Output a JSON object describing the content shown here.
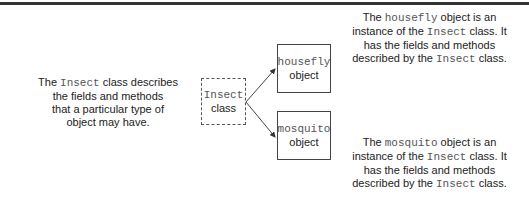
{
  "diagram": {
    "class_caption": {
      "pre": "The ",
      "code": "Insect",
      "post_lines": [
        " class describes",
        "the fields and methods",
        "that a particular type of",
        "object may have."
      ]
    },
    "class_box": {
      "name": "Insect",
      "label": "class"
    },
    "objects": [
      {
        "name": "housefly",
        "label": "object",
        "caption": {
          "l1_pre": "The ",
          "l1_code": "housefly",
          "l1_post": " object is an",
          "l2_pre": "instance of the ",
          "l2_code": "Insect",
          "l2_post": " class. It",
          "l3": "has the fields and methods",
          "l4_pre": "described by the ",
          "l4_code": "Insect",
          "l4_post": " class."
        }
      },
      {
        "name": "mosquito",
        "label": "object",
        "caption": {
          "l1_pre": "The ",
          "l1_code": "mosquito",
          "l1_post": " object is an",
          "l2_pre": "instance of the ",
          "l2_code": "Insect",
          "l2_post": " class. It",
          "l3": "has the fields and methods",
          "l4_pre": "described by the ",
          "l4_code": "Insect",
          "l4_post": " class."
        }
      }
    ],
    "colors": {
      "rule": "#333333",
      "text": "#222222",
      "code": "#555555",
      "border": "#444444"
    }
  }
}
